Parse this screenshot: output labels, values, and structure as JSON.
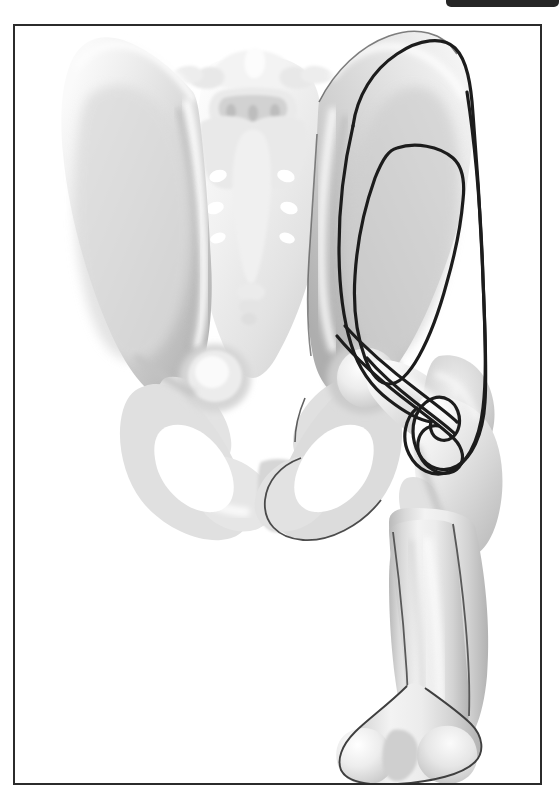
{
  "page": {
    "background_color": "#ffffff",
    "width": 559,
    "height": 799
  },
  "top_bar": {
    "name": "top-bar",
    "color": "#262626",
    "label": ""
  },
  "figure": {
    "title": "",
    "caption": "",
    "frame_color": "#2b2b2b",
    "background_color": "#ffffff",
    "illustration_type": "anatomical line-and-tone illustration",
    "view": "anteroposterior",
    "subject": "pelvis with right hip and femur",
    "palette": {
      "bone_light": "#f2f2f2",
      "bone_mid": "#dedede",
      "bone_shadow": "#bdbdbd",
      "bone_deep_shadow": "#9e9e9e",
      "bone_highlight": "#fbfbfb",
      "outline": "#333333",
      "marking_line": "#1c1c1c"
    },
    "structures": [
      {
        "id": "left-ilium",
        "label": "Left ilium (iliac wing)"
      },
      {
        "id": "right-ilium",
        "label": "Right ilium (iliac wing)"
      },
      {
        "id": "sacrum",
        "label": "Sacrum"
      },
      {
        "id": "lumbar-vertebrae",
        "label": "Lumbar vertebrae"
      },
      {
        "id": "coccyx",
        "label": "Coccyx"
      },
      {
        "id": "left-obturator-foramen",
        "label": "Left obturator foramen"
      },
      {
        "id": "right-obturator-foramen",
        "label": "Right obturator foramen"
      },
      {
        "id": "pubic-symphysis",
        "label": "Pubic symphysis"
      },
      {
        "id": "left-acetabulum",
        "label": "Left acetabulum"
      },
      {
        "id": "right-acetabulum",
        "label": "Right acetabulum"
      },
      {
        "id": "femoral-head",
        "label": "Femoral head"
      },
      {
        "id": "femoral-neck",
        "label": "Femoral neck"
      },
      {
        "id": "greater-trochanter",
        "label": "Greater trochanter"
      },
      {
        "id": "lesser-trochanter",
        "label": "Lesser trochanter"
      },
      {
        "id": "femoral-shaft",
        "label": "Femoral shaft"
      },
      {
        "id": "femoral-condyles",
        "label": "Femoral condyles"
      }
    ],
    "markings": [
      {
        "id": "outer-marking-outline",
        "label": "Outer marking outline",
        "stroke_color": "#1c1c1c",
        "stroke_width": 3.2,
        "closed": true
      },
      {
        "id": "inner-marking-outline",
        "label": "Inner marking outline",
        "stroke_color": "#1c1c1c",
        "stroke_width": 3.2,
        "closed": true
      }
    ]
  }
}
